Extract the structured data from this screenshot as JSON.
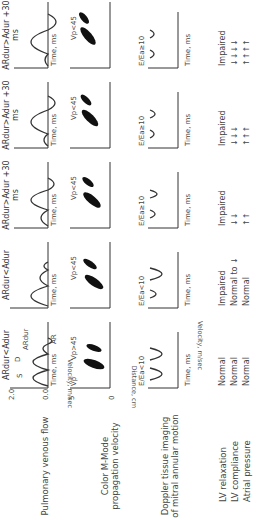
{
  "rows": {
    "pv": "Pulmonary venous flow",
    "cmm": "Color M-Mode propagation velocity",
    "dti": "Doppler tissue imaging of mitral annular motion",
    "relax": "LV relaxation",
    "compl": "LV compliance",
    "atrial": "Atrial pressure"
  },
  "axes": {
    "velocity": "Velocity, m/sec",
    "distance": "Distance, cm",
    "velocity_dti": "Velocity, m/sec",
    "time": "Time, ms",
    "pv_top": "2.0",
    "pv_bottom": "0.0",
    "cmm_top": "5",
    "cmm_bottom": "0"
  },
  "columns": [
    {
      "pv_title": "ARdur<Adur",
      "pv_S": "S",
      "pv_D": "D",
      "pv_ARdur": "ARdur",
      "pv_AR": "AR",
      "cmm": "Vp>45",
      "cmm_vp": "Vp",
      "dti": "E/Ea<10",
      "dti_e": "e'",
      "dti_a": "a'",
      "relax": "Normal",
      "compl": "Normal",
      "atrial": "Normal"
    },
    {
      "pv_title": "ARdur<Adur",
      "cmm": "Vp<45",
      "dti": "E/Ea<10",
      "relax": "Impaired",
      "compl": "Normal to ↓",
      "atrial": "Normal"
    },
    {
      "pv_title": "ARdur>Adur +30 ms",
      "cmm": "Vp<45",
      "dti": "E/Ea≥10",
      "relax": "Impaired",
      "compl": "↓↓",
      "atrial": "↑↑"
    },
    {
      "pv_title": "ARdur>Adur +30 ms",
      "cmm": "Vp<45",
      "dti": "E/Ea≥10",
      "relax": "Impaired",
      "compl": "↓↓↓",
      "atrial": "↑↑↑"
    },
    {
      "pv_title": "ARdur>Adur +30 ms",
      "cmm": "Vp<45",
      "dti": "E/Ea≥10",
      "relax": "Impaired",
      "compl": "↓↓↓↓",
      "atrial": "↑↑↑↑"
    }
  ]
}
